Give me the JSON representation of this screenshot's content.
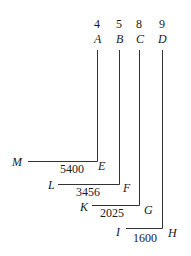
{
  "diagram": {
    "columns": [
      {
        "number": "4",
        "top_label": "A",
        "bottom_label": "E",
        "left_label": "M",
        "value": "5400"
      },
      {
        "number": "5",
        "top_label": "B",
        "bottom_label": "F",
        "left_label": "L",
        "value": "3456"
      },
      {
        "number": "8",
        "top_label": "C",
        "bottom_label": "G",
        "left_label": "K",
        "value": "2025"
      },
      {
        "number": "9",
        "top_label": "D",
        "bottom_label": "H",
        "left_label": "I",
        "value": "1600"
      }
    ],
    "line_color": "#333333"
  }
}
